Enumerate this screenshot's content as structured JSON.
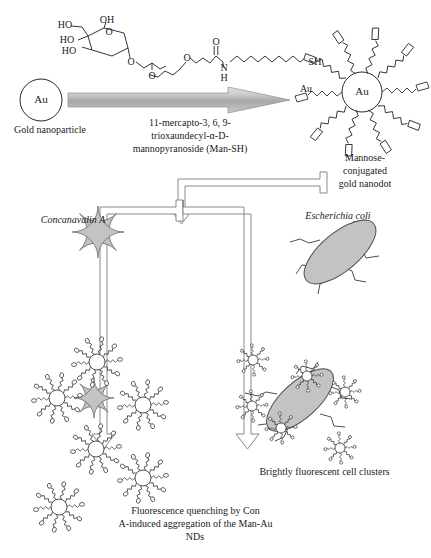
{
  "figure": {
    "colors": {
      "gray_fill": "#c3c3c3",
      "gray_stroke": "#6b6b6b",
      "ink": "#1a1a1a",
      "arrow_bar_light": "#d8d8d8",
      "arrow_bar_dark": "#9a9a9a",
      "hollow_arrow_stroke": "#7a7a7a"
    }
  },
  "reagent_structure": {
    "name": "Man-SH ligand structural formula",
    "atoms": {
      "ho_1": "HO",
      "ho_2": "HO",
      "ho_3": "HO",
      "oh_1": "OH",
      "ring_o": "O",
      "glycosidic_o": "O",
      "ether_o_1": "O",
      "ether_o_2": "O",
      "carbonyl_o": "O",
      "amide_n": "N",
      "amide_h": "H",
      "thiol": "SH"
    }
  },
  "gold_nanoparticle": {
    "core_label": "Au",
    "caption": "Gold nanoparticle"
  },
  "reaction_arrow": {
    "name": "conjugation-arrow",
    "caption_line_1": "11-mercapto-3, 6, 9-",
    "caption_line_2": "trioxaundecyl-α-D-",
    "caption_line_3": "mannopyranoside (Man-SH)",
    "caption_full": "11-mercapto-3, 6, 9-trioxaundecyl-α-D-mannopyranoside (Man-SH)"
  },
  "nanodot": {
    "core_label": "Au",
    "pointer_label": "Au",
    "caption_line_1": "Mannose-",
    "caption_line_2": "conjugated",
    "caption_line_3": "gold nanodot",
    "caption_full": "Mannose-conjugated gold nanodot",
    "ligand_count": 10
  },
  "branch_arrows": {
    "name": "branching-flow-arrows",
    "left_branch": "left pathway to Concanavalin A",
    "right_branch": "right pathway to Escherichia coli"
  },
  "analytes": {
    "con_a": {
      "label": "Concanavalin A",
      "shape": "four-lobed clover"
    },
    "ecoli": {
      "label": "Escherichia coli",
      "shape": "tilted gray ellipse with pili"
    }
  },
  "outcomes": {
    "left": {
      "caption_line_1": "Fluorescence quenching by Con",
      "caption_line_2": "A-induced aggregation of the Man-Au",
      "caption_line_3": "NDs",
      "caption_full": "Fluorescence quenching by Con A-induced aggregation of the Man-Au NDs",
      "nanodot_count": 6
    },
    "right": {
      "caption": "Brightly fluorescent cell clusters",
      "nanodot_count": 6
    }
  }
}
